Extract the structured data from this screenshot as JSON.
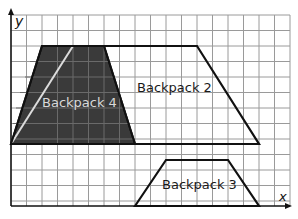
{
  "diagram": {
    "type": "coordinate-grid-trapezoids",
    "axes": {
      "x_label": "x",
      "y_label": "y"
    },
    "grid": {
      "columns": 18,
      "rows": 12,
      "line_color": "#9a9a9a"
    },
    "shapes": [
      {
        "id": "backpack-4",
        "label": "Backpack 4",
        "fill": "#3a3a3a",
        "label_color": "#d8d8d8",
        "vertices_grid": [
          [
            2,
            10
          ],
          [
            6,
            10
          ],
          [
            8,
            4
          ],
          [
            0,
            4
          ]
        ]
      },
      {
        "id": "backpack-2",
        "label": "Backpack 2",
        "fill": "none",
        "label_color": "#1a1a1a",
        "vertices_grid": [
          [
            0,
            4
          ],
          [
            4,
            10
          ],
          [
            12,
            10
          ],
          [
            16,
            4
          ]
        ]
      },
      {
        "id": "backpack-3",
        "label": "Backpack 3",
        "fill": "none",
        "label_color": "#1a1a1a",
        "vertices_grid": [
          [
            8,
            0
          ],
          [
            10,
            3
          ],
          [
            14,
            3
          ],
          [
            16,
            0
          ]
        ]
      }
    ]
  }
}
